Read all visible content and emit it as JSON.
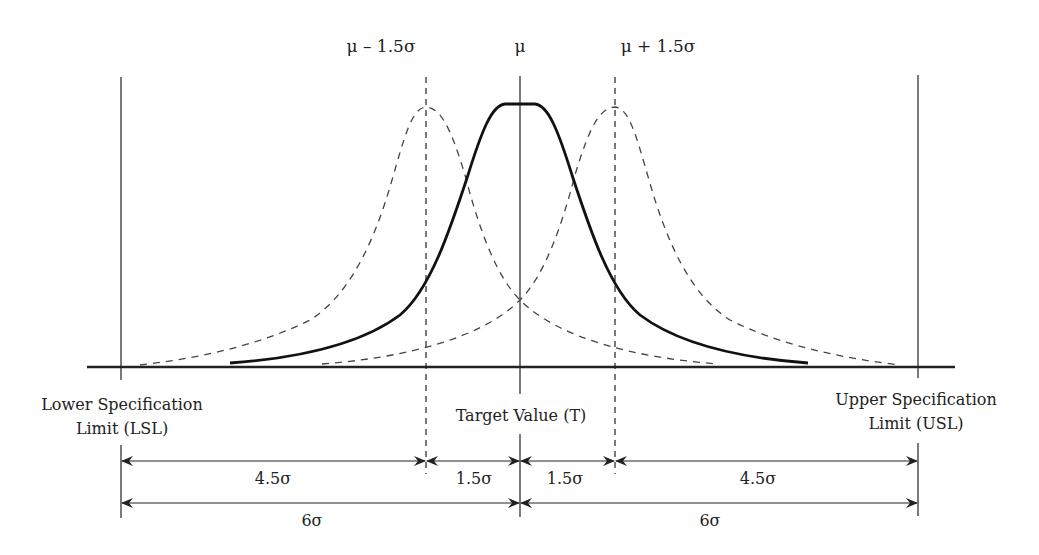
{
  "diagram": {
    "top_labels": {
      "left_shift": "μ – 1.5σ",
      "mean": "μ",
      "right_shift": "μ + 1.5σ"
    },
    "limits": {
      "lsl_line1": "Lower Specification",
      "lsl_line2": "Limit (LSL)",
      "target": "Target Value (T)",
      "usl_line1": "Upper Specification",
      "usl_line2": "Limit (USL)"
    },
    "dimensions": {
      "row1": [
        "4.5σ",
        "1.5σ",
        "1.5σ",
        "4.5σ"
      ],
      "row2": [
        "6σ",
        "6σ"
      ]
    },
    "curves": [
      {
        "name": "centered distribution",
        "style": "solid",
        "center": "μ"
      },
      {
        "name": "shifted left distribution",
        "style": "dashed",
        "center": "μ – 1.5σ"
      },
      {
        "name": "shifted right distribution",
        "style": "dashed",
        "center": "μ + 1.5σ"
      }
    ],
    "colors": {
      "ink": "#222222",
      "background": "#ffffff"
    }
  }
}
